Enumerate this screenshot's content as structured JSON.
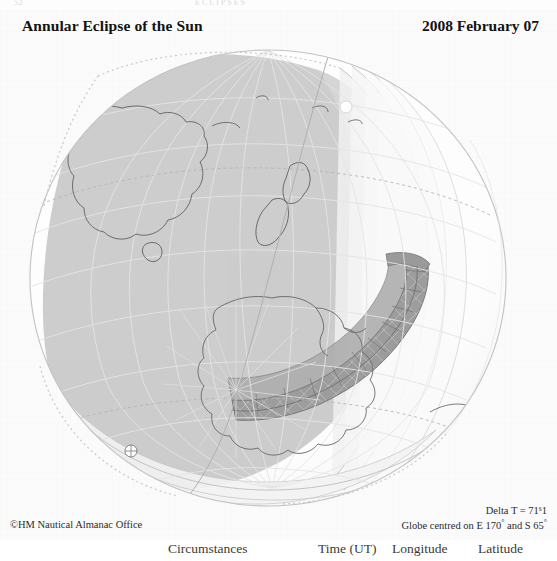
{
  "page": {
    "folio": "52",
    "running_head": "ECLIPSES"
  },
  "plate": {
    "title": "Annular Eclipse of the Sun",
    "date": "2008 February 07",
    "credit": "©HM Nautical Almanac Office",
    "delta_t_label": "Delta T = 71",
    "delta_t_sup": "s",
    "delta_t_frac": "1",
    "globe_centre_prefix": "Globe centred on E 170",
    "globe_centre_mid": " and S 65",
    "degree": "°"
  },
  "map": {
    "projection": "orthographic-globe",
    "centre_longitude": "E 170°",
    "centre_latitude": "S 65°",
    "graticule_spacing_deg": 15,
    "features": [
      "Australia",
      "Tasmania",
      "New Zealand",
      "Antarctica",
      "South Pole",
      "Southern Ocean"
    ],
    "markers": [
      {
        "name": "south-pole-marker",
        "label": "South Pole"
      },
      {
        "name": "greatest-eclipse-marker",
        "label": "Greatest eclipse"
      }
    ],
    "shading": {
      "penumbra_label": "Region of partial eclipse",
      "annular_path_label": "Path of annular eclipse",
      "limb_label": "Sunrise / sunset limit"
    },
    "colors": {
      "paper": "#fbfbfb",
      "globe_light": "#fdfdfd",
      "penumbra": "#c9c9c9",
      "penumbra_mid": "#d8d8d8",
      "penumbra_light": "#ededed",
      "annular_band": "#9d9d9d",
      "coastline": "#5a5a5a",
      "graticule": "#e9e9e9",
      "graticule_dark": "#bfbfbf",
      "outline": "#8a8a8a",
      "text": "#131313"
    }
  },
  "table_stub": {
    "headers": [
      {
        "label": "Circumstances",
        "x": 168
      },
      {
        "label": "Time (UT)",
        "x": 330
      },
      {
        "label": "Longitude",
        "x": 400
      },
      {
        "label": "Latitude",
        "x": 480
      }
    ]
  }
}
